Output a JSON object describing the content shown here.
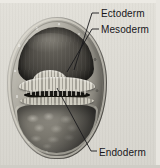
{
  "figure": {
    "background_color": "#dcdad3",
    "label_color": "#17161a",
    "leader_color": "#1a1a1c"
  },
  "labels": [
    {
      "id": "ectoderm",
      "text": "Ectoderm",
      "x": 101,
      "y": 8
    },
    {
      "id": "mesoderm",
      "text": "Mesoderm",
      "x": 101,
      "y": 24
    },
    {
      "id": "endoderm",
      "text": "Endoderm",
      "x": 99,
      "y": 147
    }
  ],
  "leaders": [
    {
      "id": "ectoderm-leader",
      "from": [
        99,
        13
      ],
      "via": [
        92,
        13
      ],
      "to": [
        74,
        70
      ]
    },
    {
      "id": "mesoderm-leader",
      "from": [
        99,
        29
      ],
      "via": [
        92,
        29
      ],
      "to": [
        67,
        72
      ]
    },
    {
      "id": "endoderm-leader",
      "from": [
        97,
        151
      ],
      "via": [
        91,
        151
      ],
      "to": [
        57,
        88
      ]
    }
  ],
  "structures": [
    {
      "id": "ectoderm-layer",
      "name": "outer ectoderm shell"
    },
    {
      "id": "mesoderm-layer",
      "name": "mesoderm plate"
    },
    {
      "id": "endoderm-layer",
      "name": "endoderm band"
    },
    {
      "id": "blastocoel-upper",
      "name": "upper cavity"
    },
    {
      "id": "archenteron",
      "name": "central slit cavity"
    },
    {
      "id": "yolk-mass",
      "name": "lower yolk cell mass"
    }
  ]
}
